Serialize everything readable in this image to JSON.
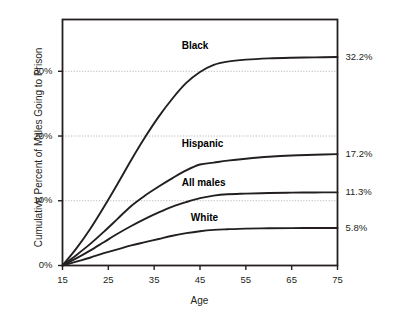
{
  "chart_data": {
    "type": "line",
    "title": "",
    "subtitle": "",
    "xlabel": "Age",
    "ylabel": "Cumulative Percent of Males Going to Prison",
    "xlim": [
      15,
      75
    ],
    "ylim": [
      0,
      38
    ],
    "xticks": [
      15,
      25,
      35,
      45,
      55,
      65,
      75
    ],
    "xtick_labels": [
      "15",
      "25",
      "35",
      "45",
      "55",
      "65",
      "75"
    ],
    "yticks": [
      0,
      10,
      20,
      30
    ],
    "ytick_labels": [
      "0%",
      "10%",
      "20%",
      "30%"
    ],
    "grid": true,
    "grid_axis": "y",
    "legend_position": "inline-labels",
    "line_color": "#231f20",
    "grid_color": "#b7b7b7",
    "frame_color": "#231f20",
    "background": "#ffffff",
    "series": [
      {
        "name": "Black",
        "end_label": "32.2%",
        "label_x": 41,
        "label_y": 33.8,
        "x": [
          15,
          18,
          21,
          24,
          27,
          30,
          33,
          36,
          39,
          42,
          45,
          48,
          51,
          55,
          60,
          65,
          70,
          75
        ],
        "values": [
          0.0,
          2.6,
          5.6,
          9.0,
          12.6,
          16.3,
          19.8,
          23.0,
          25.8,
          28.2,
          29.9,
          31.0,
          31.5,
          31.8,
          32.0,
          32.1,
          32.15,
          32.2
        ]
      },
      {
        "name": "Hispanic",
        "end_label": "17.2%",
        "label_x": 41,
        "label_y": 18.6,
        "x": [
          15,
          18,
          21,
          24,
          27,
          30,
          33,
          36,
          39,
          42,
          45,
          48,
          51,
          55,
          60,
          65,
          70,
          75
        ],
        "values": [
          0.0,
          1.6,
          3.3,
          5.2,
          7.2,
          9.2,
          10.8,
          12.2,
          13.5,
          14.7,
          15.6,
          15.9,
          16.2,
          16.5,
          16.8,
          17.0,
          17.1,
          17.2
        ]
      },
      {
        "name": "All males",
        "end_label": "11.3%",
        "label_x": 41,
        "label_y": 12.6,
        "x": [
          15,
          18,
          21,
          24,
          27,
          30,
          33,
          36,
          39,
          42,
          45,
          48,
          51,
          55,
          60,
          65,
          70,
          75
        ],
        "values": [
          0.0,
          1.1,
          2.3,
          3.6,
          4.9,
          6.1,
          7.2,
          8.2,
          9.1,
          9.8,
          10.4,
          10.8,
          11.0,
          11.1,
          11.2,
          11.25,
          11.28,
          11.3
        ]
      },
      {
        "name": "White",
        "end_label": "5.8%",
        "label_x": 43,
        "label_y": 7.2,
        "x": [
          15,
          18,
          21,
          24,
          27,
          30,
          33,
          36,
          39,
          42,
          45,
          48,
          51,
          55,
          60,
          65,
          70,
          75
        ],
        "values": [
          0.0,
          0.6,
          1.2,
          1.9,
          2.5,
          3.1,
          3.6,
          4.1,
          4.6,
          5.0,
          5.3,
          5.5,
          5.6,
          5.7,
          5.75,
          5.78,
          5.79,
          5.8
        ]
      }
    ]
  }
}
